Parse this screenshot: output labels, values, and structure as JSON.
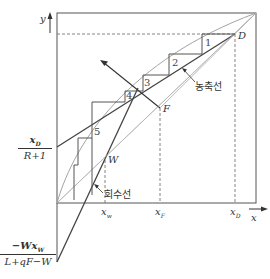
{
  "axes": {
    "x_label": "x",
    "y_label": "y"
  },
  "ticks": {
    "x_w": "x",
    "x_w_sub": "w",
    "x_F": "x",
    "x_F_sub": "F",
    "x_D": "x",
    "x_D_sub": "D"
  },
  "points": {
    "D": "D",
    "F": "F",
    "W": "W"
  },
  "lines": {
    "rectifying_label": "농축선",
    "stripping_label": "회수선"
  },
  "intercepts": {
    "rectifying_num": "x",
    "rectifying_num_sub": "D",
    "rectifying_den": "R+1",
    "stripping_num": "−Wx",
    "stripping_num_sub": "W",
    "stripping_den": "L+qF−W"
  },
  "stages": [
    "1",
    "2",
    "3",
    "4",
    "5"
  ],
  "colors": {
    "frame": "#555555",
    "curve": "#999999",
    "operating_line": "#444444",
    "dashed": "#666666"
  }
}
